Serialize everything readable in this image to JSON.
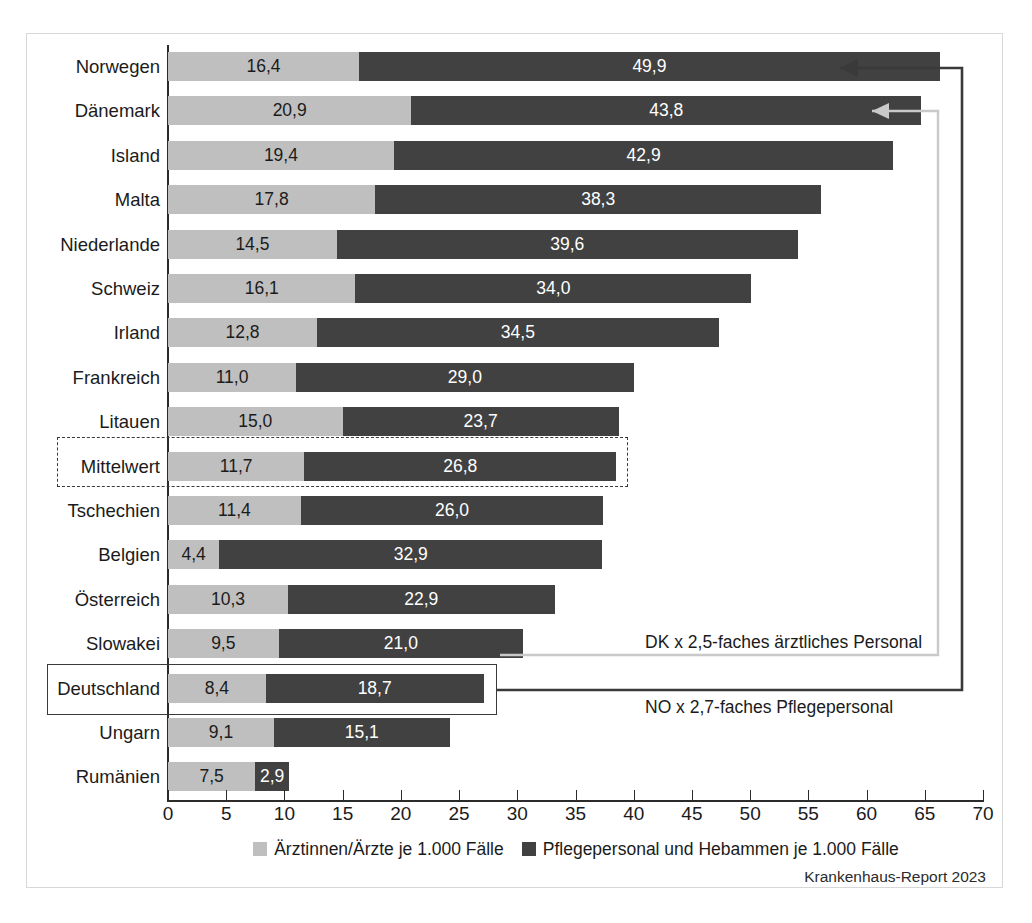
{
  "source_note": "Krankenhaus-Report 2023",
  "colors": {
    "light": "#bfbfbf",
    "dark": "#414141",
    "frame": "#d8d8d8",
    "axis": "#2b2b2b",
    "arrow_dark": "#3a3a3a",
    "arrow_light": "#c9c9c9"
  },
  "legend": [
    {
      "key": "light",
      "label": "Ärztinnen/Ärzte je 1.000 Fälle"
    },
    {
      "key": "dark",
      "label": "Pflegepersonal und Hebammen je 1.000 Fälle"
    }
  ],
  "annotations": [
    {
      "id": "dk",
      "text": "DK x 2,5-faches ärztliches Personal"
    },
    {
      "id": "no",
      "text": "NO x 2,7-faches Pflegepersonal"
    }
  ],
  "highlights": [
    {
      "id": "mittelwert",
      "style": "dashed",
      "row": "Mittelwert"
    },
    {
      "id": "deutschland",
      "style": "solid",
      "row": "Deutschland"
    }
  ],
  "chart_data": {
    "type": "bar",
    "orientation": "horizontal",
    "stacked": true,
    "title": "",
    "xlabel": "",
    "ylabel": "",
    "xlim": [
      0,
      70
    ],
    "xticks": [
      0,
      5,
      10,
      15,
      20,
      25,
      30,
      35,
      40,
      45,
      50,
      55,
      60,
      65,
      70
    ],
    "xtick_labels": [
      "0",
      "5",
      "10",
      "15",
      "20",
      "25",
      "30",
      "35",
      "40",
      "45",
      "50",
      "55",
      "60",
      "65",
      "70"
    ],
    "grid": false,
    "legend_position": "bottom",
    "categories": [
      "Norwegen",
      "Dänemark",
      "Island",
      "Malta",
      "Niederlande",
      "Schweiz",
      "Irland",
      "Frankreich",
      "Litauen",
      "Mittelwert",
      "Tschechien",
      "Belgien",
      "Österreich",
      "Slowakei",
      "Deutschland",
      "Ungarn",
      "Rumänien"
    ],
    "series": [
      {
        "name": "Ärztinnen/Ärzte je 1.000 Fälle",
        "color": "#bfbfbf",
        "values": [
          16.4,
          20.9,
          19.4,
          17.8,
          14.5,
          16.1,
          12.8,
          11.0,
          15.0,
          11.7,
          11.4,
          4.4,
          10.3,
          9.5,
          8.4,
          9.1,
          7.5
        ],
        "labels": [
          "16,4",
          "20,9",
          "19,4",
          "17,8",
          "14,5",
          "16,1",
          "12,8",
          "11,0",
          "15,0",
          "11,7",
          "11,4",
          "4,4",
          "10,3",
          "9,5",
          "8,4",
          "9,1",
          "7,5"
        ]
      },
      {
        "name": "Pflegepersonal und Hebammen je 1.000 Fälle",
        "color": "#414141",
        "values": [
          49.9,
          43.8,
          42.9,
          38.3,
          39.6,
          34.0,
          34.5,
          29.0,
          23.7,
          26.8,
          26.0,
          32.9,
          22.9,
          21.0,
          18.7,
          15.1,
          2.9
        ],
        "labels": [
          "49,9",
          "43,8",
          "42,9",
          "38,3",
          "39,6",
          "34,0",
          "34,5",
          "29,0",
          "23,7",
          "26,8",
          "26,0",
          "32,9",
          "22,9",
          "21,0",
          "18,7",
          "15,1",
          "2,9"
        ]
      }
    ],
    "totals": [
      66.3,
      64.7,
      62.3,
      56.1,
      54.1,
      50.1,
      47.3,
      40.0,
      38.7,
      38.5,
      37.4,
      37.3,
      33.2,
      30.5,
      27.1,
      24.2,
      10.4
    ]
  }
}
